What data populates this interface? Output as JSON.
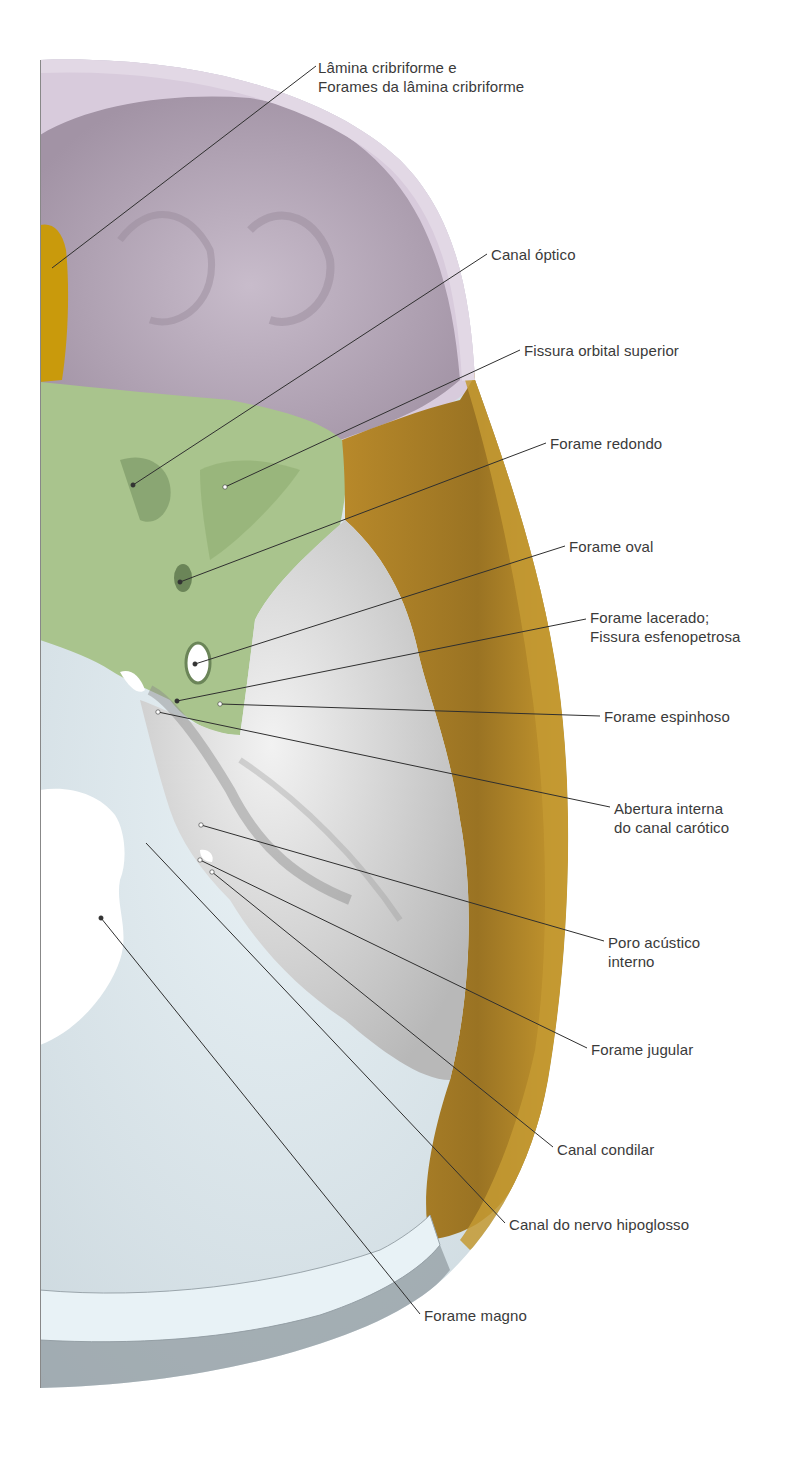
{
  "figure": {
    "colors": {
      "frontal": "#d8cbdc",
      "frontal_inner": "#b9abbd",
      "ethmoid": "#c99a0c",
      "sphenoid": "#a9c48d",
      "sphenoid_dark": "#7e9a68",
      "temporal": "#b6882a",
      "temporal_dark": "#8f6a1f",
      "petrous": "#e4e4e4",
      "petrous_shade": "#c4c4c4",
      "occipital": "#dbe8ef",
      "occipital_shade": "#aab6bd",
      "leader_line": "#2f2f2f",
      "label_text": "#3a3a3a"
    }
  },
  "labels": [
    {
      "id": "lamina-cribriforme",
      "lines": [
        "Lâmina cribriforme e",
        "Forames da lâmina cribriforme"
      ],
      "x": 318,
      "y": 58,
      "line": [
        [
          316,
          66
        ],
        [
          52,
          268
        ]
      ]
    },
    {
      "id": "canal-optico",
      "lines": [
        "Canal óptico"
      ],
      "x": 491,
      "y": 245,
      "line": [
        [
          487,
          254
        ],
        [
          133,
          485
        ]
      ]
    },
    {
      "id": "fissura-orbital-superior",
      "lines": [
        "Fissura orbital superior"
      ],
      "x": 524,
      "y": 341,
      "line": [
        [
          520,
          350
        ],
        [
          225,
          487
        ]
      ]
    },
    {
      "id": "forame-redondo",
      "lines": [
        "Forame redondo"
      ],
      "x": 550,
      "y": 434,
      "line": [
        [
          546,
          443
        ],
        [
          180,
          582
        ]
      ]
    },
    {
      "id": "forame-oval",
      "lines": [
        "Forame oval"
      ],
      "x": 569,
      "y": 537,
      "line": [
        [
          565,
          546
        ],
        [
          195,
          664
        ]
      ]
    },
    {
      "id": "forame-lacerado",
      "lines": [
        "Forame lacerado;",
        "Fissura esfenopetrosa"
      ],
      "x": 590,
      "y": 608,
      "line": [
        [
          586,
          619
        ],
        [
          177,
          701
        ]
      ]
    },
    {
      "id": "forame-espinhoso",
      "lines": [
        "Forame espinhoso"
      ],
      "x": 604,
      "y": 707,
      "line": [
        [
          600,
          716
        ],
        [
          220,
          704
        ]
      ]
    },
    {
      "id": "abertura-canal-carotico",
      "lines": [
        "Abertura interna",
        "do canal carótico"
      ],
      "x": 614,
      "y": 799,
      "line": [
        [
          610,
          807
        ],
        [
          158,
          712
        ]
      ]
    },
    {
      "id": "poro-acustico-interno",
      "lines": [
        "Poro acústico",
        "interno"
      ],
      "x": 608,
      "y": 933,
      "line": [
        [
          604,
          941
        ],
        [
          201,
          825
        ]
      ]
    },
    {
      "id": "forame-jugular",
      "lines": [
        "Forame jugular"
      ],
      "x": 591,
      "y": 1040,
      "line": [
        [
          587,
          1048
        ],
        [
          200,
          860
        ]
      ]
    },
    {
      "id": "canal-condilar",
      "lines": [
        "Canal condilar"
      ],
      "x": 557,
      "y": 1140,
      "line": [
        [
          553,
          1147
        ],
        [
          212,
          872
        ]
      ]
    },
    {
      "id": "canal-nervo-hipoglosso",
      "lines": [
        "Canal do nervo hipoglosso"
      ],
      "x": 509,
      "y": 1215,
      "line": [
        [
          505,
          1223
        ],
        [
          146,
          843
        ]
      ]
    },
    {
      "id": "forame-magno",
      "lines": [
        "Forame magno"
      ],
      "x": 424,
      "y": 1306,
      "line": [
        [
          420,
          1314
        ],
        [
          101,
          918
        ]
      ]
    }
  ],
  "points": [
    {
      "id": "pt-canal-optico",
      "x": 133,
      "y": 485,
      "color": "#333333"
    },
    {
      "id": "pt-fissura-orbital",
      "x": 225,
      "y": 487,
      "color": "#ffffff"
    },
    {
      "id": "pt-forame-redondo",
      "x": 180,
      "y": 582,
      "color": "#333333"
    },
    {
      "id": "pt-forame-oval",
      "x": 195,
      "y": 664,
      "color": "#333333"
    },
    {
      "id": "pt-lacerado",
      "x": 177,
      "y": 701,
      "color": "#333333"
    },
    {
      "id": "pt-espinhoso",
      "x": 220,
      "y": 704,
      "color": "#ffffff"
    },
    {
      "id": "pt-carotico",
      "x": 158,
      "y": 712,
      "color": "#ffffff"
    },
    {
      "id": "pt-acustico",
      "x": 201,
      "y": 825,
      "color": "#ffffff"
    },
    {
      "id": "pt-jugular",
      "x": 200,
      "y": 860,
      "color": "#ffffff"
    },
    {
      "id": "pt-condilar",
      "x": 212,
      "y": 872,
      "color": "#ffffff"
    },
    {
      "id": "pt-magno",
      "x": 101,
      "y": 918,
      "color": "#333333"
    }
  ]
}
